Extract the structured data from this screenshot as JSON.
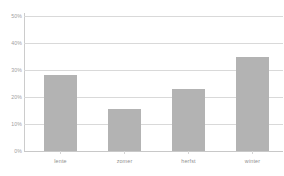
{
  "chart_data": {
    "type": "bar",
    "title": "",
    "xlabel": "",
    "ylabel": "",
    "categories": [
      "lente",
      "zomer",
      "herfst",
      "winter"
    ],
    "values": [
      28,
      15.5,
      23,
      35
    ],
    "value_labels": [
      "28%",
      "15.5%",
      "23%",
      "35%"
    ],
    "ylim": [
      0,
      50
    ],
    "y_ticks": [
      0,
      10,
      20,
      30,
      40,
      50
    ],
    "y_tick_labels": [
      "0%",
      "10%",
      "20%",
      "30%",
      "40%",
      "50%"
    ],
    "grid": true,
    "legend": false,
    "legend_position": "none",
    "series": [
      {
        "name": "",
        "values": [
          28,
          15.5,
          23,
          35
        ]
      }
    ]
  },
  "style": {
    "bar_color": "#b3b3b3",
    "gridline_color": "#d9d9d9",
    "axis_color": "#cccccc",
    "label_color": "#8f8f8f",
    "background": "#ffffff"
  }
}
